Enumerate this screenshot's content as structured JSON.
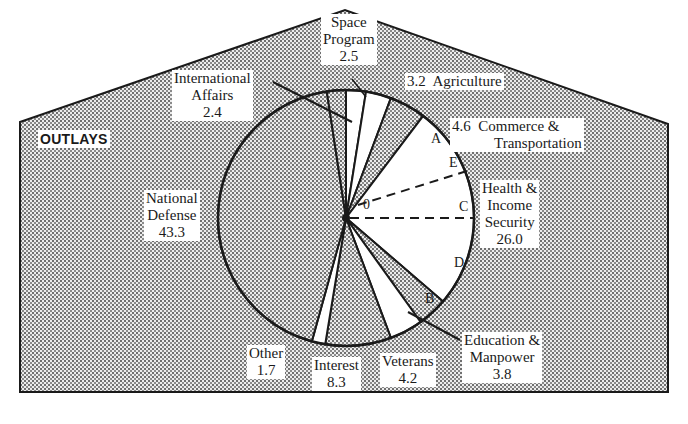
{
  "chart_data": {
    "type": "pie",
    "title": "OUTLAYS",
    "units": "percent of total outlays",
    "start_angle_deg": 0,
    "direction": "clockwise",
    "slices": [
      {
        "label": "Space Program",
        "value": 2.5,
        "fill": "white"
      },
      {
        "label": "International Affairs (partial)",
        "value": 0.0,
        "fill": "dots"
      },
      {
        "label": "Agriculture",
        "value": 3.2,
        "fill": "white"
      },
      {
        "label": "Commerce & Transportation",
        "value": 4.6,
        "fill": "dots"
      },
      {
        "label": "Health & Income Security",
        "value": 26.0,
        "fill": "white"
      },
      {
        "label": "Education & Manpower",
        "value": 3.8,
        "fill": "dots"
      },
      {
        "label": "Veterans",
        "value": 4.2,
        "fill": "white"
      },
      {
        "label": "Interest",
        "value": 8.3,
        "fill": "dots"
      },
      {
        "label": "Other",
        "value": 1.7,
        "fill": "white"
      },
      {
        "label": "National Defense",
        "value": 43.3,
        "fill": "dots"
      },
      {
        "label": "International Affairs",
        "value": 2.4,
        "fill": "dots"
      }
    ],
    "categories": [
      "Space Program",
      "Agriculture",
      "Commerce & Transportation",
      "Health & Income Security",
      "Education & Manpower",
      "Veterans",
      "Interest",
      "Other",
      "National Defense",
      "International Affairs"
    ],
    "values": [
      2.5,
      3.2,
      4.6,
      26.0,
      3.8,
      4.2,
      8.3,
      1.7,
      43.3,
      2.4
    ],
    "point_labels": [
      "A",
      "B",
      "C",
      "D",
      "E",
      "0"
    ],
    "legend": "none (direct labels)"
  },
  "title": "OUTLAYS",
  "labels": {
    "space": {
      "line1": "Space",
      "line2": "Program",
      "value": "2.5"
    },
    "intl": {
      "line1": "International",
      "line2": "Affairs",
      "value": "2.4"
    },
    "agri": {
      "text": "3.2  Agriculture"
    },
    "commerce": {
      "line1": "4.6  Commerce &",
      "line2": "Transportation"
    },
    "health": {
      "line1": "Health &",
      "line2": "Income",
      "line3": "Security",
      "value": "26.0"
    },
    "defense": {
      "line1": "National",
      "line2": "Defense",
      "value": "43.3"
    },
    "education": {
      "line1": "Education &",
      "line2": "Manpower",
      "value": "3.8"
    },
    "veterans": {
      "line1": "Veterans",
      "value": "4.2"
    },
    "interest": {
      "line1": "Interest",
      "value": "8.3"
    },
    "other": {
      "line1": "Other",
      "value": "1.7"
    }
  },
  "points": {
    "A": "A",
    "B": "B",
    "C": "C",
    "D": "D",
    "E": "E",
    "O": "0"
  },
  "colors": {
    "stroke": "#1a1a1a",
    "dot": "#7a7a7a",
    "paper": "#ffffff"
  }
}
